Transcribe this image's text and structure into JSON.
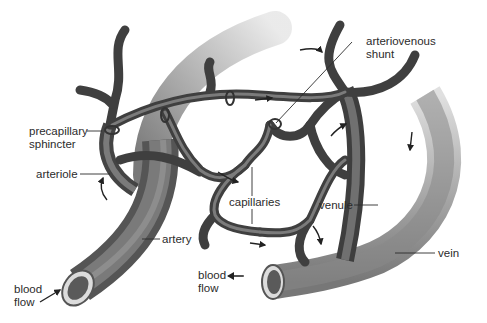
{
  "diagram": {
    "labels": {
      "precapillary_sphincter_1": "precapillary",
      "precapillary_sphincter_2": "sphincter",
      "arteriole": "arteriole",
      "artery": "artery",
      "blood_flow_in_1": "blood",
      "blood_flow_in_2": "flow",
      "capillaries": "capillaries",
      "arteriovenous_shunt_1": "arteriovenous",
      "arteriovenous_shunt_2": "shunt",
      "venule": "venule",
      "vein": "vein",
      "blood_flow_out_1": "blood",
      "blood_flow_out_2": "flow"
    },
    "colors": {
      "vessel_dark": "#3c3c3c",
      "vessel_mid": "#6e6e6e",
      "vessel_light": "#b4b4b4",
      "leader_line": "#2b2b2b",
      "background": "#ffffff"
    }
  }
}
